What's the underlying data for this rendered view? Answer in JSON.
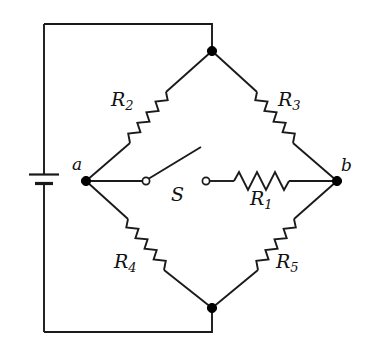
{
  "figure": {
    "kind": "circuit-schematic",
    "stroke_color": "#1a1a1a",
    "background_color": "#ffffff"
  },
  "labels": {
    "node_a": "a",
    "node_b": "b",
    "switch": "S",
    "r1_main": "R",
    "r1_sub": "1",
    "r2_main": "R",
    "r2_sub": "2",
    "r3_main": "R",
    "r3_sub": "3",
    "r4_main": "R",
    "r4_sub": "4",
    "r5_main": "R",
    "r5_sub": "5"
  },
  "components": {
    "battery": {
      "name": "battery",
      "orientation": "vertical",
      "x": 44,
      "y": 179
    },
    "switch": {
      "name": "switch-S",
      "state": "open",
      "left_terminal_x": 146,
      "right_terminal_x": 205,
      "y": 181
    },
    "resistors": [
      {
        "id": "R1",
        "branch": "bridge-a-to-b",
        "orientation": "horizontal"
      },
      {
        "id": "R2",
        "branch": "a-to-top",
        "orientation": "diagonal-up-right"
      },
      {
        "id": "R3",
        "branch": "top-to-b",
        "orientation": "diagonal-down-right"
      },
      {
        "id": "R4",
        "branch": "a-to-bottom",
        "orientation": "diagonal-down-right"
      },
      {
        "id": "R5",
        "branch": "bottom-to-b",
        "orientation": "diagonal-up-right"
      }
    ],
    "nodes": [
      {
        "id": "top",
        "x": 212,
        "y": 51,
        "filled": true
      },
      {
        "id": "a",
        "x": 86,
        "y": 181,
        "filled": true
      },
      {
        "id": "b",
        "x": 337,
        "y": 181,
        "filled": true
      },
      {
        "id": "bottom",
        "x": 212,
        "y": 308,
        "filled": true
      }
    ]
  }
}
